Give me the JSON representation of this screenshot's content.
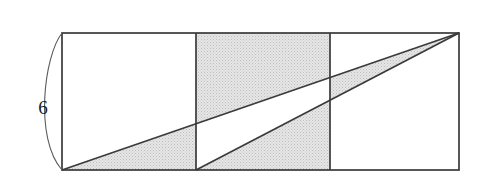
{
  "figure": {
    "background_color": "#ffffff",
    "stroke_color": "#3a3a3a",
    "shade_color": "#dedede",
    "shade_stipple_color": "#b4b4b4",
    "label_color": "#1a1a1a",
    "rectangle": {
      "x": 62,
      "y": 33,
      "width": 397,
      "height": 137,
      "squares": 3,
      "divider_x": [
        196,
        330
      ]
    },
    "diagonals": [
      {
        "name": "diagonal-bottom-left-to-top-right",
        "from": [
          62,
          170
        ],
        "to": [
          459,
          33
        ]
      },
      {
        "name": "diagonal-first-divider-to-top-right",
        "from": [
          196,
          170
        ],
        "to": [
          459,
          33
        ]
      }
    ],
    "brace": {
      "name": "height-brace",
      "side": "left",
      "top": [
        62,
        33
      ],
      "bottom": [
        62,
        170
      ]
    },
    "dimension_label": {
      "text": "6",
      "x": 43,
      "y": 110,
      "refers_to": "height of rectangle"
    }
  }
}
